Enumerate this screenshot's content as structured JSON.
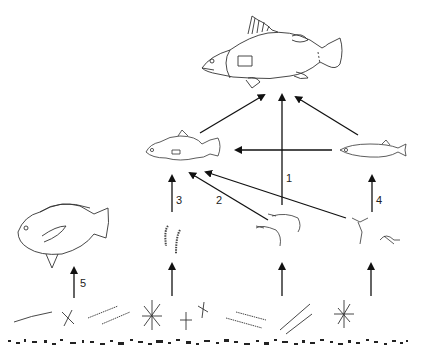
{
  "diagram": {
    "type": "food-web",
    "nodes": [
      {
        "id": "top-predator",
        "label": "large predatory fish (perch-like)",
        "icon": "large-fish-icon"
      },
      {
        "id": "mid-predator",
        "label": "juvenile predatory fish",
        "icon": "small-perch-icon"
      },
      {
        "id": "forage-fish",
        "label": "small slender forage fish",
        "icon": "minnow-icon"
      },
      {
        "id": "tilapia",
        "label": "deep-bodied herbivorous fish",
        "icon": "tilapia-icon"
      },
      {
        "id": "worms",
        "label": "chironomid larvae / worms",
        "icon": "worm-icon"
      },
      {
        "id": "shrimp",
        "label": "shrimp",
        "icon": "shrimp-icon"
      },
      {
        "id": "copepods",
        "label": "copepods / zooplankton",
        "icon": "copepod-icon"
      },
      {
        "id": "phytoplankton",
        "label": "phytoplankton and detritus",
        "icon": "algae-icon"
      }
    ],
    "edges": [
      {
        "from": "mid-predator",
        "to": "top-predator"
      },
      {
        "from": "shrimp",
        "to": "top-predator",
        "label": "1"
      },
      {
        "from": "forage-fish",
        "to": "top-predator"
      },
      {
        "from": "forage-fish",
        "to": "mid-predator"
      },
      {
        "from": "shrimp",
        "to": "mid-predator",
        "label": "2"
      },
      {
        "from": "copepods",
        "to": "mid-predator"
      },
      {
        "from": "worms",
        "to": "mid-predator",
        "label": "3"
      },
      {
        "from": "copepods",
        "to": "forage-fish",
        "label": "4"
      },
      {
        "from": "phytoplankton",
        "to": "tilapia",
        "label": "5"
      },
      {
        "from": "phytoplankton",
        "to": "worms"
      },
      {
        "from": "phytoplankton",
        "to": "shrimp"
      },
      {
        "from": "phytoplankton",
        "to": "copepods"
      }
    ],
    "labels": {
      "l1": "1",
      "l2": "2",
      "l3": "3",
      "l4": "4",
      "l5": "5"
    }
  }
}
